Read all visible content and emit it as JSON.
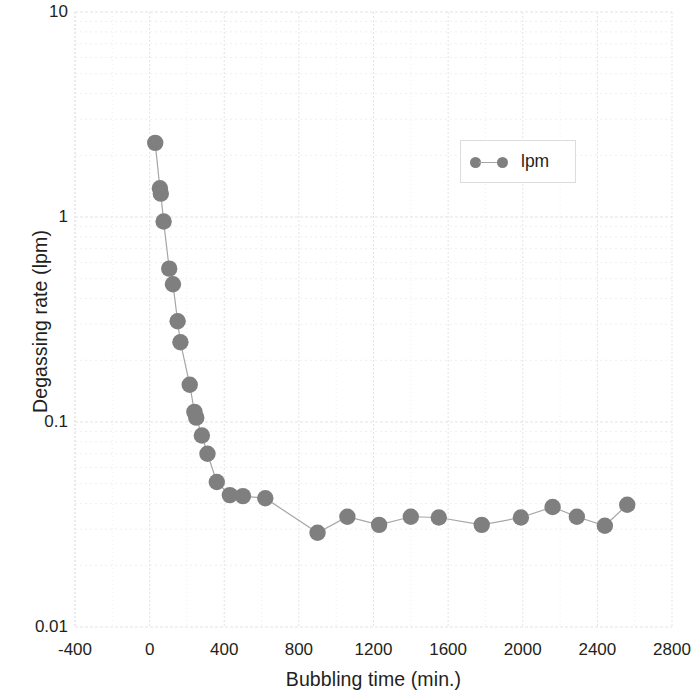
{
  "chart_data": {
    "type": "line",
    "title": "",
    "subtitle": "",
    "xlabel": "Bubbling time (min.)",
    "ylabel": "Degassing rate (lpm)",
    "yscale": "log",
    "xscale": "linear",
    "xlim": [
      -400,
      2800
    ],
    "ylim": [
      0.01,
      10
    ],
    "xticks": [
      -400,
      0,
      400,
      800,
      1200,
      1600,
      2000,
      2400,
      2800
    ],
    "xtick_labels": [
      "-400",
      "0",
      "400",
      "800",
      "1200",
      "1600",
      "2000",
      "2400",
      "2800"
    ],
    "yticks": [
      10,
      1,
      0.1,
      0.01
    ],
    "ytick_labels": [
      "10",
      "1",
      "0.1",
      "0.01"
    ],
    "grid": true,
    "grid_minor": true,
    "legend_position": "upper right",
    "series": [
      {
        "name": "lpm",
        "marker": "circle",
        "color": "#7f7f7f",
        "line_color": "#a6a6a6",
        "x": [
          30,
          55,
          60,
          75,
          105,
          125,
          150,
          165,
          215,
          240,
          250,
          280,
          310,
          360,
          430,
          500,
          620,
          900,
          1060,
          1230,
          1400,
          1550,
          1780,
          1990,
          2160,
          2290,
          2440,
          2560
        ],
        "y": [
          2.3,
          1.38,
          1.3,
          0.95,
          0.56,
          0.47,
          0.31,
          0.245,
          0.152,
          0.112,
          0.105,
          0.086,
          0.07,
          0.051,
          0.044,
          0.0435,
          0.0425,
          0.0288,
          0.0345,
          0.0315,
          0.0345,
          0.0342,
          0.0315,
          0.0342,
          0.0385,
          0.0345,
          0.0312,
          0.0395
        ]
      }
    ]
  },
  "legend": {
    "entries": [
      {
        "label": "lpm",
        "color": "#7f7f7f",
        "line_color": "#a6a6a6"
      }
    ]
  },
  "axes": {
    "x_label": "Bubbling time (min.)",
    "y_label": "Degassing rate (lpm)"
  },
  "colors": {
    "marker": "#7f7f7f",
    "line": "#a6a6a6",
    "grid_major": "#e3e3e6",
    "grid_minor": "#efeff1",
    "text": "#231f20",
    "legend_border": "#dcdcdc"
  }
}
